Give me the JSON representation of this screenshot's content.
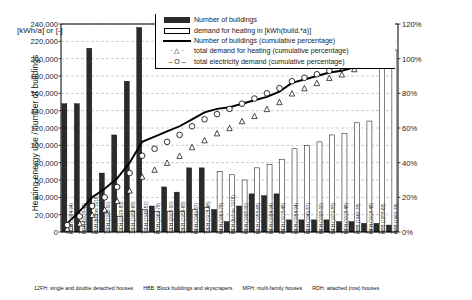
{
  "axes": {
    "left_title": "Heating energy use / number of buildings",
    "right_title": "Cumulative percentage",
    "unit_label": "[kWh/a] or [-]",
    "left_ticks": [
      "240,000",
      "220,000",
      "200,000",
      "180,000",
      "160,000",
      "140,000",
      "120,000",
      "100,000",
      "80,000",
      "60,000",
      "40,000",
      "20,000",
      "0"
    ],
    "right_ticks": [
      "120%",
      "100%",
      "80%",
      "60%",
      "40%",
      "20%",
      "0%"
    ]
  },
  "legend": {
    "items": [
      {
        "icon": "dark-bar-swatch",
        "label": "Number of buildings"
      },
      {
        "icon": "white-bar-swatch",
        "label": "demand for heating in [kWh(build.*a)]"
      },
      {
        "icon": "solid-line-swatch",
        "label": "Number of buildings (cumulative percentage)"
      },
      {
        "icon": "triangle-marker-swatch",
        "label": "total demand for heating (cumulative percentage)"
      },
      {
        "icon": "circle-marker-swatch",
        "label": "total electricity demand (cumulative percentage)"
      }
    ]
  },
  "caption": {
    "entries": [
      "12FH: single and double detached houses",
      "HBB: Block buildings and skyscrapers",
      "MFH: multi-family houses",
      "RDH: attached (row) houses"
    ]
  },
  "colors": {
    "bar_dark": "#2b2b2b",
    "bar_white": "#ffffff",
    "line": "#000000",
    "axis": "#000000",
    "grid": "#9a9a9a"
  },
  "chart_data": {
    "type": "bar",
    "title": "",
    "xlabel": "",
    "ylabel": "Heating energy use / number of buildings",
    "ylabel_secondary": "Cumulative percentage",
    "ylim": [
      0,
      240000
    ],
    "ylim_secondary": [
      0,
      1.2
    ],
    "grid": true,
    "legend_position": "top-center",
    "categories": [
      "RDH (1984-94)",
      "RDH (1918-48)",
      "RDH (before 1918)",
      "12FH (1995-00)",
      "12FH (1979-83)",
      "12FH (1958-68)",
      "12FH (1949-57)",
      "RDH (1969-78)",
      "12FH (2005-00)",
      "12FH (1958-68)",
      "MFH (1949-57)",
      "12FH (1918-48)",
      "MFH (1969-78)",
      "MFH (before 1918)",
      "MFH (1995-00)",
      "MFH (1958-68)",
      "MFH (1984-94)",
      "MFH (1918-48)",
      "MFH (1984-94)",
      "MFH (1949-57)",
      "MFH (1995-00)",
      "MFH (1979-83)",
      "MFH (1918-48)",
      "HBB (1949-78)",
      "MFH (1918-48)",
      "HBB (1958-68)",
      "HBB (1969-78)"
    ],
    "series": [
      {
        "name": "Number of buildings",
        "axis": "left",
        "type": "bar",
        "color": "#2b2b2b",
        "values": [
          148000,
          148000,
          212000,
          68000,
          112000,
          174000,
          236000,
          30000,
          52000,
          46000,
          74000,
          74000,
          26000,
          12000,
          30000,
          44000,
          42000,
          44000,
          14000,
          14000,
          14000,
          14000,
          12000,
          12000,
          10000,
          10000,
          8000
        ]
      },
      {
        "name": "demand for heating in [kWh(build.*a)]",
        "axis": "left",
        "type": "bar",
        "color": "#ffffff",
        "values": [
          8000,
          12000,
          20000,
          22000,
          18000,
          24000,
          26000,
          24000,
          24000,
          24000,
          26000,
          28000,
          70000,
          66000,
          60000,
          74000,
          78000,
          84000,
          96000,
          100000,
          104000,
          112000,
          114000,
          126000,
          128000,
          206000,
          210000
        ]
      },
      {
        "name": "Number of buildings (cumulative percentage)",
        "axis": "right",
        "type": "line",
        "marker": "none",
        "values": [
          0.05,
          0.12,
          0.2,
          0.25,
          0.31,
          0.4,
          0.52,
          0.55,
          0.58,
          0.61,
          0.65,
          0.69,
          0.71,
          0.72,
          0.74,
          0.76,
          0.78,
          0.81,
          0.86,
          0.88,
          0.9,
          0.92,
          0.93,
          0.95,
          0.96,
          0.98,
          1.0
        ]
      },
      {
        "name": "total demand for heating (cumulative percentage)",
        "axis": "right",
        "type": "scatter",
        "marker": "triangle",
        "values": [
          0.02,
          0.05,
          0.1,
          0.13,
          0.18,
          0.24,
          0.32,
          0.36,
          0.4,
          0.44,
          0.49,
          0.53,
          0.57,
          0.6,
          0.64,
          0.67,
          0.71,
          0.75,
          0.8,
          0.83,
          0.86,
          0.89,
          0.91,
          0.94,
          0.96,
          0.98,
          1.0
        ]
      },
      {
        "name": "total electricity demand (cumulative percentage)",
        "axis": "right",
        "type": "scatter",
        "marker": "circle",
        "values": [
          0.04,
          0.09,
          0.15,
          0.2,
          0.26,
          0.34,
          0.44,
          0.48,
          0.52,
          0.56,
          0.61,
          0.65,
          0.68,
          0.71,
          0.74,
          0.77,
          0.8,
          0.83,
          0.87,
          0.89,
          0.91,
          0.93,
          0.95,
          0.96,
          0.98,
          0.99,
          1.0
        ]
      }
    ]
  }
}
